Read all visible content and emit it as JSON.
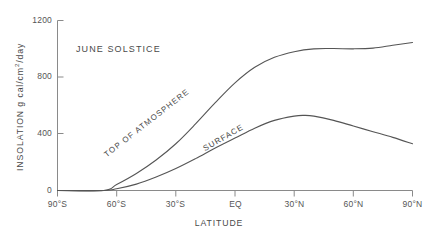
{
  "chart_data": {
    "type": "line",
    "title": "JUNE SOLSTICE",
    "xlabel": "LATITUDE",
    "ylabel": "INSOLATION g cal/cm2/day",
    "ylabel_prefix": "INSOLATION g cal/cm",
    "ylabel_exponent": "2",
    "ylabel_suffix": "/day",
    "xlim": [
      -90,
      90
    ],
    "ylim": [
      0,
      1200
    ],
    "grid": false,
    "legend": "inline-curve-labels",
    "line_color": "#555555",
    "axis_color": "#8a8a8a",
    "y_ticks": [
      0,
      400,
      800,
      1200
    ],
    "y_tick_labels": [
      "0",
      "400",
      "800",
      "1200"
    ],
    "x_ticks": [
      -90,
      -60,
      -30,
      0,
      30,
      60,
      90
    ],
    "x_tick_labels": [
      "90°S",
      "60°S",
      "30°S",
      "EQ",
      "30°N",
      "60°N",
      "90°N"
    ],
    "series": [
      {
        "name": "TOP OF ATMOSPHERE",
        "label": "TOP OF  ATMOSPHERE",
        "x": [
          -90,
          -80,
          -70,
          -66.5,
          -60,
          -50,
          -40,
          -30,
          -20,
          -10,
          0,
          10,
          20,
          30,
          40,
          50,
          60,
          70,
          80,
          90
        ],
        "values": [
          0,
          0,
          0,
          0,
          42,
          120,
          215,
          330,
          470,
          620,
          760,
          870,
          940,
          980,
          1000,
          1002,
          1000,
          1005,
          1025,
          1045
        ]
      },
      {
        "name": "SURFACE",
        "label": "SURFACE",
        "x": [
          -90,
          -80,
          -70,
          -66.5,
          -60,
          -50,
          -40,
          -30,
          -20,
          -10,
          0,
          10,
          20,
          30,
          35,
          40,
          50,
          60,
          70,
          80,
          90
        ],
        "values": [
          0,
          0,
          0,
          0,
          12,
          45,
          95,
          155,
          225,
          300,
          370,
          440,
          495,
          525,
          530,
          525,
          495,
          455,
          415,
          375,
          330
        ]
      }
    ],
    "annotations": [
      {
        "text": "JUNE SOLSTICE",
        "type": "title-inline"
      },
      {
        "text": "TOP OF  ATMOSPHERE",
        "type": "curve-label"
      },
      {
        "text": "SURFACE",
        "type": "curve-label"
      }
    ]
  }
}
